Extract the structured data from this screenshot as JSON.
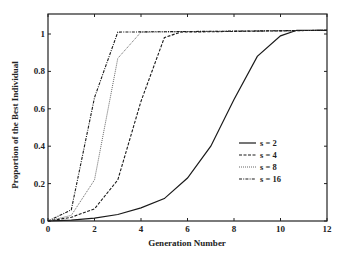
{
  "chart_data": {
    "type": "line",
    "title": "",
    "xlabel": "Generation Number",
    "ylabel": "Proportion of the Best Individual",
    "xlim": [
      0,
      12
    ],
    "ylim": [
      0,
      1.1
    ],
    "xticks": [
      0,
      2,
      4,
      6,
      8,
      10,
      12
    ],
    "yticks": [
      0,
      0.2,
      0.4,
      0.6,
      0.8,
      1
    ],
    "ytick_labels": [
      "0",
      "0.2",
      "0.4",
      "0.6",
      "0.8",
      "1"
    ],
    "grid": false,
    "legend_position": "center-right",
    "series": [
      {
        "name": "s = 2",
        "style": "solid",
        "x": [
          0,
          1,
          2,
          3,
          4,
          5,
          6,
          7,
          8,
          9,
          10,
          10.7,
          12
        ],
        "y": [
          0,
          0.005,
          0.015,
          0.035,
          0.07,
          0.12,
          0.23,
          0.4,
          0.65,
          0.88,
          0.99,
          1.02,
          1.02
        ]
      },
      {
        "name": "s = 4",
        "style": "dashed",
        "x": [
          0,
          1,
          2,
          3,
          4,
          5,
          5.7,
          12
        ],
        "y": [
          0,
          0.02,
          0.065,
          0.22,
          0.64,
          0.98,
          1.01,
          1.02
        ]
      },
      {
        "name": "s = 8",
        "style": "dotted",
        "x": [
          0,
          1,
          2,
          3,
          4,
          12
        ],
        "y": [
          0,
          0.03,
          0.22,
          0.87,
          1.01,
          1.02
        ]
      },
      {
        "name": "s = 16",
        "style": "dashdot",
        "x": [
          0,
          1,
          2,
          3,
          12
        ],
        "y": [
          0,
          0.06,
          0.66,
          1.01,
          1.02
        ]
      }
    ]
  }
}
